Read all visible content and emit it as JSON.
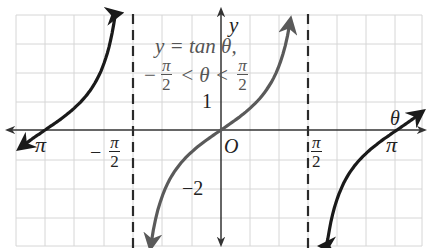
{
  "chart_data": {
    "type": "line",
    "title": "",
    "equation": {
      "line1": "y = tan θ,",
      "line2_left": "−",
      "line2_num": "π",
      "line2_den": "2",
      "line2_mid": "< θ <",
      "line2_right_num": "π",
      "line2_right_den": "2"
    },
    "xlabel": "θ",
    "ylabel": "y",
    "origin_label": "O",
    "x_ticks": [
      {
        "value": -3.14159,
        "label": "−π"
      },
      {
        "value": -1.5708,
        "label": "−π/2"
      },
      {
        "value": 1.5708,
        "label": "π/2"
      },
      {
        "value": 3.14159,
        "label": "π"
      }
    ],
    "y_ticks": [
      {
        "value": 1,
        "label": "1"
      },
      {
        "value": -2,
        "label": "−2"
      }
    ],
    "asymptotes": [
      -1.5708,
      1.5708
    ],
    "grid": true,
    "series": [
      {
        "name": "tan θ (principal branch, −π/2 < θ < π/2)",
        "color": "#5a5a5a",
        "domain": [
          -1.25,
          1.23
        ],
        "emphasized": true
      },
      {
        "name": "tan θ (branch −π < θ < −π/2)",
        "color": "#1a1a1a",
        "domain": [
          -3.2,
          -1.87
        ]
      },
      {
        "name": "tan θ (branch π/2 < θ < π)",
        "color": "#1a1a1a",
        "domain": [
          1.84,
          3.2
        ]
      }
    ],
    "xlim": [
      -3.6,
      3.6
    ],
    "ylim": [
      -4,
      4.5
    ]
  },
  "labels": {
    "y_axis": "y",
    "theta_axis": "θ",
    "origin": "O",
    "one": "1",
    "minus_two": "−2",
    "pi_right": "π",
    "pi_left": "π",
    "minus": "−",
    "pi": "π",
    "two": "2"
  }
}
